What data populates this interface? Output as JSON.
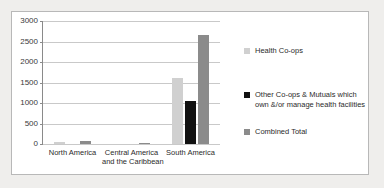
{
  "chart_data": {
    "type": "bar",
    "title": "",
    "xlabel": "",
    "ylabel": "",
    "ylim": [
      0,
      3000
    ],
    "grid": true,
    "legend_position": "right",
    "categories": [
      "North America",
      "Central America and the Caribbean",
      "South America"
    ],
    "category_lines": [
      [
        "North America"
      ],
      [
        "Central America",
        "and the Caribbean"
      ],
      [
        "South America"
      ]
    ],
    "yticks": [
      0,
      500,
      1000,
      1500,
      2000,
      2500,
      3000
    ],
    "ytick_labels": [
      "0",
      "500",
      "1000",
      "1500",
      "2000",
      "2500",
      "3000"
    ],
    "series": [
      {
        "name": "Health Co-ops",
        "color": "#d0d0d0",
        "values": [
          60,
          0,
          1600
        ]
      },
      {
        "name": "Other Co-ops & Mutuals which own &/or manage health facilities",
        "color": "#111111",
        "values": [
          0,
          0,
          1060
        ]
      },
      {
        "name": "Combined Total",
        "color": "#8b8b8b",
        "values": [
          70,
          20,
          2650
        ]
      }
    ]
  },
  "legend": {
    "items": [
      {
        "label": "Health Co-ops",
        "color": "#d0d0d0"
      },
      {
        "label": "Other Co-ops & Mutuals which own &/or manage health facilities",
        "color": "#111111"
      },
      {
        "label": "Combined Total",
        "color": "#8b8b8b"
      }
    ]
  },
  "axis": {
    "y_labels": [
      "3000",
      "2500",
      "2000",
      "1500",
      "1000",
      "500",
      "0"
    ]
  }
}
